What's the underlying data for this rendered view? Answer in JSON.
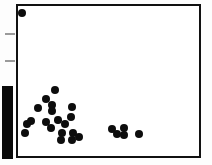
{
  "figure": {
    "type": "scatter-plot-scan",
    "width": 212,
    "height": 165,
    "background_color": "#ffffff"
  },
  "frame": {
    "x": 16,
    "y": 4,
    "width": 185,
    "height": 154,
    "border_color": "#111111",
    "border_width": 2
  },
  "artifact": {
    "name": "scan-edge-bar",
    "x": 2,
    "y": 86,
    "width": 11,
    "height": 73,
    "color": "#0a0a0a"
  },
  "axis_ticks": {
    "color": "#9a9a9a",
    "left": [
      {
        "y": 33,
        "x": 5,
        "length": 10
      },
      {
        "y": 60,
        "x": 5,
        "length": 10
      }
    ]
  },
  "chart_data": {
    "type": "scatter",
    "title": "",
    "xlabel": "",
    "ylabel": "",
    "xlim": [
      0,
      212
    ],
    "ylim": [
      165,
      0
    ],
    "grid": false,
    "legend": null,
    "marker_color": "#0d0d0d",
    "series": [
      {
        "name": "observations",
        "points": [
          {
            "x": 22,
            "y": 13,
            "r": 4.2,
            "group": "outlier"
          },
          {
            "x": 55,
            "y": 90,
            "r": 4.2,
            "group": "main-cluster"
          },
          {
            "x": 46,
            "y": 99,
            "r": 4.0,
            "group": "main-cluster"
          },
          {
            "x": 52,
            "y": 105,
            "r": 4.0,
            "group": "main-cluster"
          },
          {
            "x": 52,
            "y": 111,
            "r": 4.0,
            "group": "main-cluster"
          },
          {
            "x": 38,
            "y": 108,
            "r": 4.0,
            "group": "main-cluster"
          },
          {
            "x": 72,
            "y": 107,
            "r": 4.2,
            "group": "main-cluster"
          },
          {
            "x": 71,
            "y": 117,
            "r": 4.0,
            "group": "main-cluster"
          },
          {
            "x": 46,
            "y": 122,
            "r": 4.0,
            "group": "main-cluster"
          },
          {
            "x": 58,
            "y": 120,
            "r": 3.8,
            "group": "main-cluster"
          },
          {
            "x": 65,
            "y": 124,
            "r": 4.0,
            "group": "main-cluster"
          },
          {
            "x": 31,
            "y": 121,
            "r": 4.0,
            "group": "main-cluster"
          },
          {
            "x": 27,
            "y": 124,
            "r": 4.0,
            "group": "main-cluster"
          },
          {
            "x": 25,
            "y": 133,
            "r": 4.0,
            "group": "main-cluster"
          },
          {
            "x": 51,
            "y": 128,
            "r": 4.0,
            "group": "main-cluster"
          },
          {
            "x": 62,
            "y": 133,
            "r": 4.0,
            "group": "main-cluster"
          },
          {
            "x": 61,
            "y": 140,
            "r": 4.2,
            "group": "main-cluster"
          },
          {
            "x": 73,
            "y": 133,
            "r": 4.2,
            "group": "main-cluster"
          },
          {
            "x": 72,
            "y": 140,
            "r": 4.2,
            "group": "main-cluster"
          },
          {
            "x": 79,
            "y": 137,
            "r": 4.0,
            "group": "main-cluster"
          },
          {
            "x": 112,
            "y": 129,
            "r": 4.0,
            "group": "right-group"
          },
          {
            "x": 117,
            "y": 134,
            "r": 4.0,
            "group": "right-group"
          },
          {
            "x": 124,
            "y": 128,
            "r": 4.0,
            "group": "right-group"
          },
          {
            "x": 124,
            "y": 135,
            "r": 4.0,
            "group": "right-group"
          },
          {
            "x": 139,
            "y": 134,
            "r": 4.0,
            "group": "right-group"
          }
        ]
      }
    ]
  }
}
